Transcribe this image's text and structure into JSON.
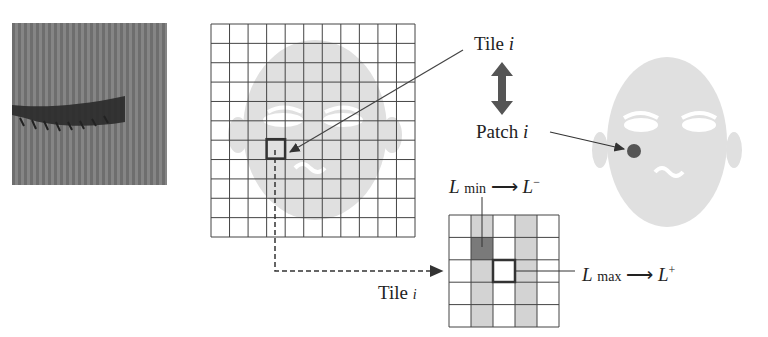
{
  "diagram": {
    "eye_patch_image": {
      "description": "grayscale close-up of closed eye with eyelashes",
      "bg_color": "#7a7a7a"
    },
    "large_grid": {
      "rows": 11,
      "cols": 11,
      "highlight_cell": {
        "row": 7,
        "col": 3
      }
    },
    "tile_label_top": {
      "text": "Tile ",
      "var": "i"
    },
    "patch_label": {
      "text": "Patch ",
      "var": "i"
    },
    "double_arrow": "double-arrow-icon",
    "tile_label_bottom": {
      "text": "Tile ",
      "var": "i"
    },
    "small_grid": {
      "rows": 5,
      "cols": 5,
      "shaded_cols": [
        1,
        3
      ],
      "min_cell": {
        "row": 1,
        "col": 1
      },
      "max_cell": {
        "row": 2,
        "col": 2
      }
    },
    "l_min": {
      "L": "L",
      "sub": "min",
      "arrow": "⟶",
      "target": "L",
      "sup": "−"
    },
    "l_max": {
      "L": "L",
      "sub": "max",
      "arrow": "⟶",
      "target": "L",
      "sup": "+"
    },
    "colors": {
      "face": "#e0e0e0",
      "grid_line": "#444444",
      "shade": "#d3d3d3",
      "min_cell": "#7a7a7a",
      "dot": "#555555",
      "arrow": "#555555"
    }
  }
}
